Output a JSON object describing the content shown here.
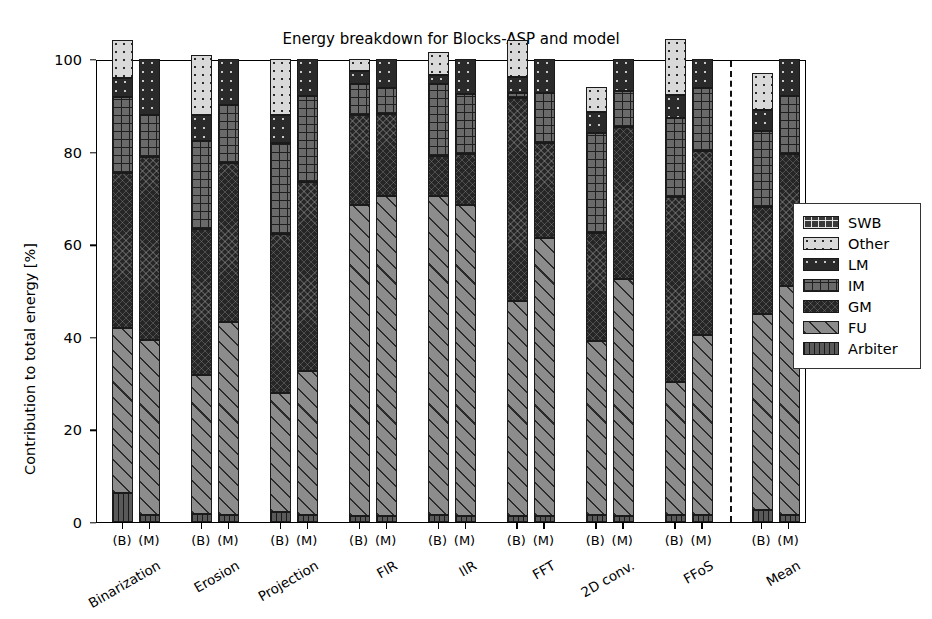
{
  "chart_data": {
    "type": "bar",
    "subtype": "stacked-bar-100-percent",
    "title": "Energy breakdown for Blocks-ASP and model",
    "xlabel": "",
    "ylabel": "Contribution to total energy [%]",
    "ylim": [
      0,
      100
    ],
    "yticks": [
      0,
      20,
      40,
      60,
      80,
      100
    ],
    "ytick_labels": [
      "0",
      "20",
      "40",
      "60",
      "80",
      "100"
    ],
    "grid": false,
    "legend_position": "right-outside",
    "legend_entries": [
      "SWB",
      "Other",
      "LM",
      "IM",
      "GM",
      "FU",
      "Arbiter"
    ],
    "stack_order_bottom_to_top": [
      "Arbiter",
      "FU",
      "GM",
      "IM",
      "LM",
      "Other",
      "SWB"
    ],
    "bar_variants": [
      "(B)",
      "(M)"
    ],
    "separator_before_group": "Mean",
    "categories": [
      "Binarization",
      "Erosion",
      "Projection",
      "FIR",
      "IIR",
      "FFT",
      "2D conv.",
      "FFoS",
      "Mean"
    ],
    "series": [
      {
        "name": "Arbiter",
        "values_B": [
          6.2,
          1.8,
          2.1,
          1.3,
          1.5,
          1.3,
          1.5,
          1.6,
          2.5
        ],
        "values_M": [
          1.5,
          1.6,
          1.6,
          1.4,
          1.4,
          1.4,
          1.4,
          1.6,
          1.5
        ]
      },
      {
        "name": "FU",
        "values_B": [
          35.6,
          30.0,
          25.7,
          67.2,
          69.0,
          46.5,
          37.5,
          28.7,
          42.5
        ],
        "values_M": [
          37.8,
          41.7,
          31.1,
          69.1,
          67.1,
          60.0,
          51.0,
          38.7,
          49.5
        ]
      },
      {
        "name": "GM",
        "values_B": [
          33.5,
          31.5,
          34.5,
          19.3,
          8.5,
          43.8,
          23.5,
          40.0,
          23.0
        ],
        "values_M": [
          39.5,
          34.2,
          40.8,
          17.6,
          11.0,
          20.5,
          33.0,
          39.8,
          28.5
        ]
      },
      {
        "name": "IM",
        "values_B": [
          16.5,
          19.0,
          19.5,
          6.8,
          15.5,
          1.0,
          21.5,
          17.0,
          16.5
        ],
        "values_M": [
          9.0,
          12.5,
          18.5,
          5.6,
          13.0,
          10.8,
          7.6,
          13.7,
          12.5
        ]
      },
      {
        "name": "LM",
        "values_B": [
          4.2,
          5.5,
          6.2,
          2.9,
          2.0,
          3.5,
          4.5,
          5.0,
          4.5
        ],
        "values_M": [
          12.2,
          10.0,
          8.0,
          6.3,
          7.5,
          7.3,
          7.0,
          6.2,
          8.0
        ]
      },
      {
        "name": "Other",
        "values_B": [
          8.0,
          13.0,
          12.0,
          2.5,
          5.0,
          8.0,
          5.5,
          12.0,
          8.0
        ],
        "values_M": [
          0.0,
          0.0,
          0.0,
          0.0,
          0.0,
          0.0,
          0.0,
          0.0,
          0.0
        ]
      },
      {
        "name": "SWB",
        "values_B": [
          0.0,
          0.0,
          0.0,
          0.0,
          0.0,
          0.0,
          0.0,
          0.0,
          0.0
        ],
        "values_M": [
          0.0,
          0.0,
          0.0,
          0.0,
          0.0,
          0.0,
          0.0,
          0.0,
          0.0
        ]
      }
    ],
    "patterns": {
      "SWB": "cross-hatch-dark",
      "Other": "dotted-light-gray",
      "LM": "solid-dark-dotted",
      "IM": "grid-gray",
      "GM": "solid-dark",
      "FU": "diagonal-gray",
      "Arbiter": "vertical-lines"
    },
    "colors": {
      "SWB": "#3a3a3a",
      "Other": "#d9d9d9",
      "LM": "#2a2a2a",
      "IM": "#6a6a6a",
      "GM": "#262626",
      "FU": "#8c8c8c",
      "Arbiter": "#5a5a5a",
      "axis": "#000000",
      "background": "#ffffff"
    }
  }
}
